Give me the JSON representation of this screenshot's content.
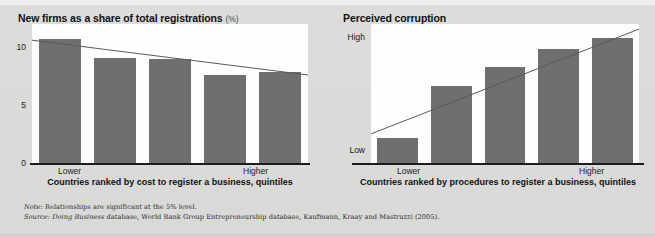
{
  "figure": {
    "note_prefix": "Note:",
    "note_text": " Relationships are significant at the 5% level.",
    "source_prefix": "Source:",
    "source_italic": " Doing Business",
    "source_text": " database, World Bank Group Entrepreneurship database, Kaufmann, Kraay and Mastruzzi (2005).",
    "background_color": "#d9d9d8",
    "bar_color": "#6f6f6f",
    "plot_color": "#fdfdfd",
    "axis_color": "#1c1c1c",
    "trend_color": "#5a5a5a"
  },
  "chart_data": [
    {
      "type": "bar",
      "id": "left",
      "title": "New firms as a share of total registrations",
      "title_unit": "(%)",
      "categories": [
        "1",
        "2",
        "3",
        "4",
        "5"
      ],
      "values": [
        10.7,
        9.1,
        9.0,
        7.6,
        7.9
      ],
      "ylabel": "",
      "yticks": [
        "10",
        "5",
        "0"
      ],
      "ytick_values": [
        10,
        5,
        0
      ],
      "ylim": [
        0,
        12
      ],
      "grid": false,
      "xlabel": "Countries ranked by cost to register a business, quintiles",
      "x_low_label": "Lower",
      "x_high_label": "Higher",
      "trendline": {
        "x0": 0.0,
        "y0": 10.6,
        "x1": 1.0,
        "y1": 7.6,
        "direction": "decreasing"
      }
    },
    {
      "type": "bar",
      "id": "right",
      "title": "Perceived corruption",
      "title_unit": "",
      "categories": [
        "1",
        "2",
        "3",
        "4",
        "5"
      ],
      "values": [
        2.0,
        6.1,
        7.6,
        9.0,
        9.9
      ],
      "ylabel": "",
      "yticks": [
        "High",
        "Low"
      ],
      "ytick_values": [
        10,
        1
      ],
      "ylim": [
        0,
        11
      ],
      "grid": false,
      "xlabel": "Countries ranked by procedures to register a business, quintiles",
      "x_low_label": "Lower",
      "x_high_label": "Higher",
      "trendline": {
        "x0": 0.0,
        "y0": 2.3,
        "x1": 1.0,
        "y1": 10.6,
        "direction": "increasing"
      }
    }
  ]
}
